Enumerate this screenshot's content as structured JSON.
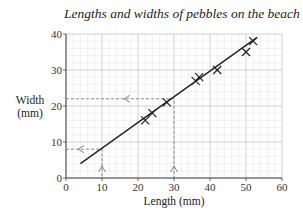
{
  "chart_data": {
    "type": "scatter",
    "title": "Lengths and widths of pebbles on the beach",
    "xlabel": "Length (mm)",
    "ylabel": "Width (mm)",
    "ylabel_lines": [
      "Width",
      "(mm)"
    ],
    "xlim": [
      0,
      60
    ],
    "ylim": [
      0,
      40
    ],
    "xticks": [
      0,
      10,
      20,
      30,
      40,
      50,
      60
    ],
    "yticks": [
      0,
      10,
      20,
      30,
      40
    ],
    "grid": true,
    "legend": null,
    "points": [
      {
        "x": 22,
        "y": 16
      },
      {
        "x": 24,
        "y": 18
      },
      {
        "x": 28,
        "y": 21
      },
      {
        "x": 36,
        "y": 27
      },
      {
        "x": 37,
        "y": 28
      },
      {
        "x": 42,
        "y": 30
      },
      {
        "x": 50,
        "y": 35
      },
      {
        "x": 52,
        "y": 38
      }
    ],
    "line_of_best_fit": {
      "x1": 4,
      "y1": 4,
      "x2": 53,
      "y2": 39
    },
    "readings": [
      {
        "x": 10,
        "y": 8
      },
      {
        "x": 30,
        "y": 22
      }
    ]
  }
}
